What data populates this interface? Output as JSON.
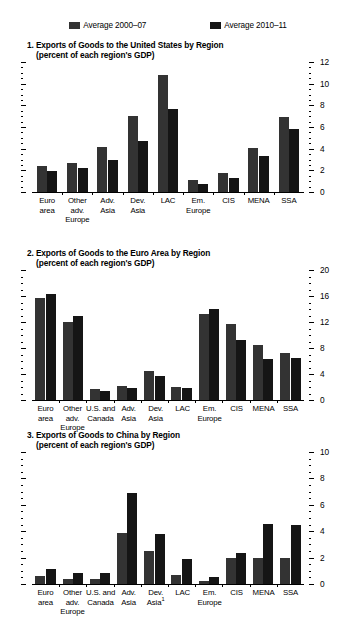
{
  "legend": {
    "items": [
      {
        "label": "Average 2000–07",
        "color": "#333333",
        "name": "average-2000-07"
      },
      {
        "label": "Average 2010–11",
        "color": "#151515",
        "name": "average-2010-11"
      }
    ]
  },
  "chart_data": [
    {
      "type": "bar",
      "panel": "1",
      "title": "1. Exports of Goods to the United States by Region",
      "subtitle": "(percent of each region's GDP)",
      "xlabel": "",
      "ylabel": "",
      "ylim": [
        0,
        12
      ],
      "yticks": [
        0,
        2,
        4,
        6,
        8,
        10,
        12
      ],
      "ytick_labels": [
        "0",
        "2",
        "4",
        "6",
        "8",
        "10",
        "12"
      ],
      "minor_tick_step": 0.5,
      "grid": false,
      "legend_position": "top-center",
      "axis_side": "right",
      "categories": [
        "Euro area",
        "Other adv. Europe",
        "Adv. Asia",
        "Dev. Asia",
        "LAC",
        "Em. Europe",
        "CIS",
        "MENA",
        "SSA"
      ],
      "category_lines": [
        [
          "Euro",
          "area"
        ],
        [
          "Other",
          "adv.",
          "Europe"
        ],
        [
          "Adv.",
          "Asia"
        ],
        [
          "Dev.",
          "Asia"
        ],
        [
          "LAC"
        ],
        [
          "Em.",
          "Europe"
        ],
        [
          "CIS"
        ],
        [
          "MENA"
        ],
        [
          "SSA"
        ]
      ],
      "series": [
        {
          "name": "Average 2000–07",
          "color": "#333333",
          "values": [
            2.4,
            2.7,
            4.2,
            7.0,
            10.8,
            1.1,
            1.75,
            4.05,
            6.95
          ]
        },
        {
          "name": "Average 2010–11",
          "color": "#151515",
          "values": [
            1.9,
            2.2,
            3.0,
            4.7,
            7.65,
            0.7,
            1.3,
            3.3,
            5.85
          ]
        }
      ]
    },
    {
      "type": "bar",
      "panel": "2",
      "title": "2. Exports of Goods to the Euro Area by Region",
      "subtitle": "(percent of each region's GDP)",
      "xlabel": "",
      "ylabel": "",
      "ylim": [
        0,
        20
      ],
      "yticks": [
        0,
        4,
        8,
        12,
        16,
        20
      ],
      "ytick_labels": [
        "0",
        "4",
        "8",
        "12",
        "16",
        "20"
      ],
      "minor_tick_step": 1,
      "grid": false,
      "legend_position": "top-center",
      "axis_side": "right",
      "categories": [
        "Euro area",
        "Other adv. Europe",
        "U.S. and Canada",
        "Adv. Asia",
        "Dev. Asia",
        "LAC",
        "Em. Europe",
        "CIS",
        "MENA",
        "SSA"
      ],
      "category_lines": [
        [
          "Euro",
          "area"
        ],
        [
          "Other",
          "adv.",
          "Europe"
        ],
        [
          "U.S. and",
          "Canada"
        ],
        [
          "Adv.",
          "Asia"
        ],
        [
          "Dev.",
          "Asia"
        ],
        [
          "LAC"
        ],
        [
          "Em.",
          "Europe"
        ],
        [
          "CIS"
        ],
        [
          "MENA"
        ],
        [
          "SSA"
        ]
      ],
      "series": [
        {
          "name": "Average 2000–07",
          "color": "#333333",
          "values": [
            15.7,
            12.0,
            1.7,
            2.1,
            4.4,
            2.0,
            13.2,
            11.7,
            8.5,
            7.3
          ]
        },
        {
          "name": "Average 2010–11",
          "color": "#151515",
          "values": [
            16.3,
            13.0,
            1.4,
            1.8,
            3.7,
            1.85,
            14.0,
            9.2,
            6.3,
            6.4
          ]
        }
      ]
    },
    {
      "type": "bar",
      "panel": "3",
      "title": "3. Exports of Goods to China by Region",
      "subtitle": "(percent of each region's GDP)",
      "xlabel": "",
      "ylabel": "",
      "ylim": [
        0,
        10
      ],
      "yticks": [
        0,
        2,
        4,
        6,
        8,
        10
      ],
      "ytick_labels": [
        "0",
        "2",
        "4",
        "6",
        "8",
        "10"
      ],
      "minor_tick_step": 0.5,
      "grid": false,
      "legend_position": "top-center",
      "axis_side": "right",
      "categories": [
        "Euro area",
        "Other adv. Europe",
        "U.S. and Canada",
        "Adv. Asia",
        "Dev. Asia1",
        "LAC",
        "Em. Europe",
        "CIS",
        "MENA",
        "SSA"
      ],
      "category_lines": [
        [
          "Euro",
          "area"
        ],
        [
          "Other",
          "adv.",
          "Europe"
        ],
        [
          "U.S. and",
          "Canada"
        ],
        [
          "Adv.",
          "Asia"
        ],
        [
          "Dev.",
          "Asia"
        ],
        [
          "LAC"
        ],
        [
          "Em.",
          "Europe"
        ],
        [
          "CIS"
        ],
        [
          "MENA"
        ],
        [
          "SSA"
        ]
      ],
      "footnote_marker": "1",
      "footnote_on_category": 4,
      "series": [
        {
          "name": "Average 2000–07",
          "color": "#333333",
          "values": [
            0.6,
            0.35,
            0.35,
            3.9,
            2.5,
            0.7,
            0.2,
            2.0,
            2.0,
            1.95
          ]
        },
        {
          "name": "Average 2010–11",
          "color": "#151515",
          "values": [
            1.15,
            0.8,
            0.85,
            6.9,
            3.8,
            1.9,
            0.5,
            2.35,
            4.55,
            4.45
          ]
        }
      ]
    }
  ]
}
